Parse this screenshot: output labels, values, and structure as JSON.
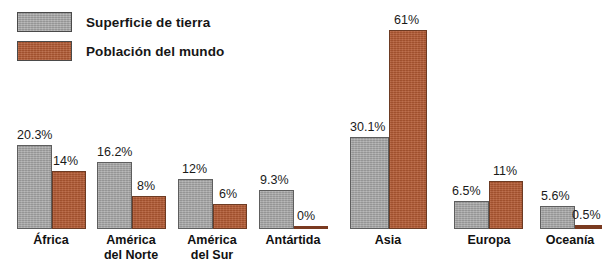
{
  "chart_data": {
    "type": "bar",
    "title": "",
    "xlabel": "",
    "ylabel": "",
    "ylim": [
      0,
      61
    ],
    "grid": false,
    "legend_position": "top-left",
    "categories": [
      "África",
      "América\ndel Norte",
      "América\ndel Sur",
      "Antártida",
      "Asia",
      "Europa",
      "Oceanía"
    ],
    "series": [
      {
        "name": "Superficie de tierra",
        "color": "#a3a3a3",
        "values": [
          20.3,
          16.2,
          12,
          9.3,
          30.1,
          6.5,
          5.6
        ],
        "labels": [
          "20.3%",
          "16.2%",
          "12%",
          "9.3%",
          "30.1%",
          "6.5%",
          "5.6%"
        ]
      },
      {
        "name": "Población del mundo",
        "color": "#b35a33",
        "values": [
          14,
          8,
          6,
          0,
          61,
          11,
          0.5
        ],
        "labels": [
          "14%",
          "8%",
          "6%",
          "0%",
          "61%",
          "11%",
          "0.5%"
        ]
      }
    ]
  },
  "legend": {
    "items": [
      {
        "label": "Superficie de tierra",
        "color": "#a3a3a3",
        "swatch": "gray"
      },
      {
        "label": "Población del mundo",
        "color": "#b35a33",
        "swatch": "red"
      }
    ]
  },
  "groups": [
    {
      "name": "africa",
      "label": "África",
      "left": 17,
      "width": 68,
      "label_left": 6,
      "label_width": 90,
      "gray": {
        "value": "20.3%",
        "h": 84,
        "w": 35,
        "val_left": 0,
        "val_bottom": 88
      },
      "red": {
        "value": "14%",
        "h": 58,
        "w": 34,
        "val_left": 36,
        "val_bottom": 62
      }
    },
    {
      "name": "america-del-norte",
      "label": "América\ndel Norte",
      "left": 97,
      "width": 68,
      "label_left": 86,
      "label_width": 90,
      "gray": {
        "value": "16.2%",
        "h": 67,
        "w": 35,
        "val_left": 0,
        "val_bottom": 71
      },
      "red": {
        "value": "8%",
        "h": 33,
        "w": 34,
        "val_left": 40,
        "val_bottom": 37
      }
    },
    {
      "name": "america-del-sur",
      "label": "América\ndel Sur",
      "left": 178,
      "width": 68,
      "label_left": 167,
      "label_width": 90,
      "gray": {
        "value": "12%",
        "h": 50,
        "w": 35,
        "val_left": 4,
        "val_bottom": 54
      },
      "red": {
        "value": "6%",
        "h": 25,
        "w": 34,
        "val_left": 41,
        "val_bottom": 29
      }
    },
    {
      "name": "antartida",
      "label": "Antártida",
      "left": 259,
      "width": 68,
      "label_left": 248,
      "label_width": 90,
      "gray": {
        "value": "9.3%",
        "h": 39,
        "w": 35,
        "val_left": 1,
        "val_bottom": 43
      },
      "red": {
        "value": "0%",
        "h": 3,
        "w": 34,
        "val_left": 38,
        "val_bottom": 7,
        "zero": true
      }
    },
    {
      "name": "asia",
      "label": "Asia",
      "left": 350,
      "width": 77,
      "label_left": 348,
      "label_width": 80,
      "gray": {
        "value": "30.1%",
        "h": 92,
        "w": 39,
        "val_left": 0,
        "val_bottom": 96
      },
      "red": {
        "value": "61%",
        "h": 199,
        "w": 38,
        "val_left": 44,
        "val_bottom": 203
      }
    },
    {
      "name": "europa",
      "label": "Europa",
      "left": 454,
      "width": 68,
      "label_left": 453,
      "label_width": 72,
      "gray": {
        "value": "6.5%",
        "h": 28,
        "w": 35,
        "val_left": -2,
        "val_bottom": 32
      },
      "red": {
        "value": "11%",
        "h": 48,
        "w": 34,
        "val_left": 39,
        "val_bottom": 52
      }
    },
    {
      "name": "oceania",
      "label": "Oceanía",
      "left": 540,
      "width": 62,
      "label_left": 534,
      "label_width": 72,
      "gray": {
        "value": "5.6%",
        "h": 23,
        "w": 35,
        "val_left": 1,
        "val_bottom": 27
      },
      "red": {
        "value": "0.5%",
        "h": 4,
        "w": 27,
        "val_left": 32,
        "val_bottom": 8,
        "zero": true
      }
    }
  ]
}
